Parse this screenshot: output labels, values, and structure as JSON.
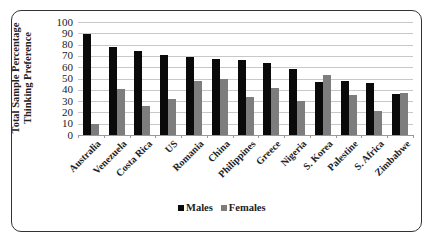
{
  "chart_data": {
    "type": "bar",
    "title": "",
    "xlabel": "",
    "ylabel": "Total Sample Percentage Thinking Preference",
    "ylabel_lines": [
      "Total Sample Percentage",
      "Thinking Preference"
    ],
    "ylim": [
      0,
      100
    ],
    "yticks": [
      0,
      10,
      20,
      30,
      40,
      50,
      60,
      70,
      80,
      90,
      100
    ],
    "grid": true,
    "legend_position": "bottom",
    "categories": [
      "Australia",
      "Venezuela",
      "Costa Rica",
      "US",
      "Romania",
      "China",
      "Philippines",
      "Greece",
      "Nigeria",
      "S. Korea",
      "Palestine",
      "S. Africa",
      "Zimbabwe"
    ],
    "series": [
      {
        "name": "Males",
        "color": "#0a0a0a",
        "values": [
          89,
          78,
          74,
          71,
          69,
          67,
          66,
          64,
          58,
          47,
          48,
          46,
          36
        ]
      },
      {
        "name": "Females",
        "color": "#7d7d7d",
        "values": [
          10,
          41,
          26,
          32,
          48,
          50,
          34,
          42,
          30,
          53,
          35,
          21,
          37
        ]
      }
    ]
  },
  "legend": {
    "males_label": "Males",
    "females_label": "Females"
  }
}
